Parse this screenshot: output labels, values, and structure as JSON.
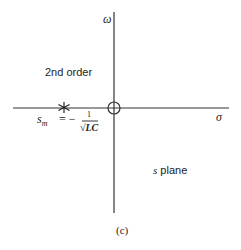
{
  "diagram": {
    "axes": {
      "vertical_label": "ω",
      "horizontal_label": "σ"
    },
    "region_labels": {
      "order": "2nd order",
      "plane_s": "s",
      "plane_word": "plane"
    },
    "pole": {
      "marker": "*",
      "formula_lhs_s": "s",
      "formula_lhs_sub": "m",
      "formula_eq": "= −",
      "formula_num": "1",
      "formula_den": "√LC"
    },
    "zero_marker": "origin circle",
    "caption": "(c)",
    "colors": {
      "line": "#333333",
      "background": "#ffffff"
    }
  }
}
